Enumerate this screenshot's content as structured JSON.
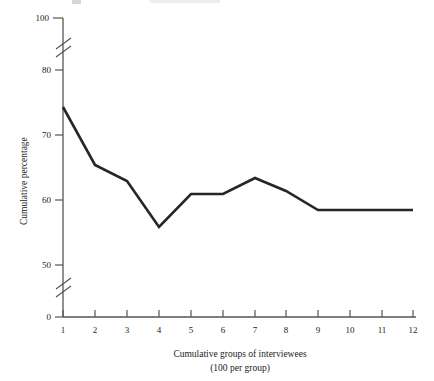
{
  "chart_data": {
    "type": "line",
    "title": "",
    "xlabel": "Cumulative groups of interviewees",
    "xlabel_sub": "(100 per group)",
    "ylabel": "Cumulative percentage",
    "x": [
      1,
      2,
      3,
      4,
      5,
      6,
      7,
      8,
      9,
      10,
      11,
      12
    ],
    "categories": [
      "1",
      "2",
      "3",
      "4",
      "5",
      "6",
      "7",
      "8",
      "9",
      "10",
      "11",
      "12"
    ],
    "values": [
      74,
      65,
      62.5,
      55.5,
      60.5,
      60.5,
      63,
      61,
      58,
      58,
      58,
      58
    ],
    "series": [
      {
        "name": "Cumulative percentage",
        "values": [
          74,
          65,
          62.5,
          55.5,
          60.5,
          60.5,
          63,
          61,
          58,
          58,
          58,
          58
        ]
      }
    ],
    "xlim": [
      1,
      12
    ],
    "ylim": [
      0,
      100
    ],
    "y_ticks": [
      0,
      50,
      60,
      70,
      80,
      100
    ],
    "y_tick_labels": [
      "0",
      "50",
      "60",
      "70",
      "80",
      "100"
    ],
    "x_ticks": [
      1,
      2,
      3,
      4,
      5,
      6,
      7,
      8,
      9,
      10,
      11,
      12
    ],
    "axis_breaks": [
      {
        "axis": "y",
        "between": [
          80,
          100
        ]
      },
      {
        "axis": "y",
        "between": [
          0,
          50
        ]
      }
    ],
    "grid": false,
    "legend": false,
    "legend_position": "none",
    "line_color": "#262626",
    "axis_color": "#555555",
    "background_color": "#ffffff",
    "markers": false
  },
  "y_axis": {
    "label": "Cumulative percentage",
    "ticks": [
      {
        "label": "100",
        "value": 100,
        "y": 18
      },
      {
        "label": "80",
        "value": 80,
        "y": 70
      },
      {
        "label": "70",
        "value": 70,
        "y": 135
      },
      {
        "label": "60",
        "value": 60,
        "y": 200
      },
      {
        "label": "50",
        "value": 50,
        "y": 265
      },
      {
        "label": "0",
        "value": 0,
        "y": 317
      }
    ]
  },
  "x_axis": {
    "label_line1": "Cumulative groups of interviewees",
    "label_line2": "(100 per group)",
    "ticks": [
      {
        "label": "1",
        "x": 63
      },
      {
        "label": "2",
        "x": 95
      },
      {
        "label": "3",
        "x": 127
      },
      {
        "label": "4",
        "x": 159
      },
      {
        "label": "5",
        "x": 191
      },
      {
        "label": "6",
        "x": 223
      },
      {
        "label": "7",
        "x": 255
      },
      {
        "label": "8",
        "x": 286
      },
      {
        "label": "9",
        "x": 318
      },
      {
        "label": "10",
        "x": 350
      },
      {
        "label": "11",
        "x": 382
      },
      {
        "label": "12",
        "x": 413
      }
    ]
  },
  "plot_points": [
    {
      "x": 63,
      "y": 107
    },
    {
      "x": 95,
      "y": 165
    },
    {
      "x": 127,
      "y": 181
    },
    {
      "x": 159,
      "y": 227
    },
    {
      "x": 191,
      "y": 194
    },
    {
      "x": 223,
      "y": 194
    },
    {
      "x": 255,
      "y": 178
    },
    {
      "x": 286,
      "y": 191
    },
    {
      "x": 318,
      "y": 210
    },
    {
      "x": 350,
      "y": 210
    },
    {
      "x": 382,
      "y": 210
    },
    {
      "x": 413,
      "y": 210
    }
  ]
}
